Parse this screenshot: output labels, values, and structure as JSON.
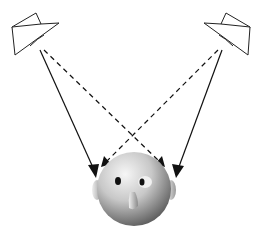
{
  "diagram": {
    "elements": {
      "left_speaker": {
        "label": "left-speaker"
      },
      "right_speaker": {
        "label": "right-speaker"
      },
      "listener_head": {
        "label": "listener-head"
      }
    },
    "paths": [
      {
        "from": "left_speaker",
        "to": "left_ear",
        "style": "solid"
      },
      {
        "from": "right_speaker",
        "to": "right_ear",
        "style": "solid"
      },
      {
        "from": "left_speaker",
        "to": "right_ear",
        "style": "dashed"
      },
      {
        "from": "right_speaker",
        "to": "left_ear",
        "style": "dashed"
      }
    ],
    "colors": {
      "line": "#111111",
      "background": "#ffffff",
      "head_light": "#f2f2f2",
      "head_dark": "#555555"
    }
  }
}
